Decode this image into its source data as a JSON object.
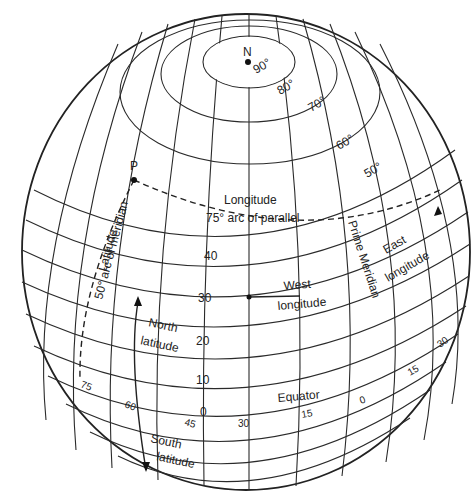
{
  "diagram": {
    "pole": {
      "label": "N",
      "degree": "90°"
    },
    "latitude_rings": [
      "80°",
      "70°",
      "60°",
      "50°"
    ],
    "parallel_labels": [
      "40",
      "30",
      "20",
      "10",
      "0"
    ],
    "meridian_labels": [
      "75",
      "60",
      "45",
      "30",
      "15",
      "0",
      "15",
      "30"
    ],
    "point_label": "P",
    "annotations": {
      "longitude": "Longitude",
      "arc_of_parallel": "75° arc of parallel",
      "latitude": "Latitude",
      "arc_of_meridian": "50° arc of meridian",
      "west": "West",
      "west_longitude": "longitude",
      "prime_meridian": "Prime Meridian",
      "east": "East",
      "east_longitude": "longitude",
      "north": "North",
      "north_latitude": "latitude",
      "equator": "Equator",
      "south": "South",
      "south_latitude": "latitude"
    },
    "colors": {
      "line": "#222222",
      "background": "#ffffff"
    }
  }
}
